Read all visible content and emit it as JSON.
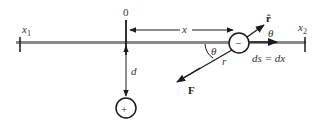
{
  "diagram": {
    "origin_label": "0",
    "x1_label": "x",
    "x1_sub": "1",
    "x2_label": "x",
    "x2_sub": "2",
    "x_label": "x",
    "d_label": "d",
    "theta_label_1": "θ",
    "theta_label_2": "θ",
    "r_label": "r",
    "rhat_label": "r̂",
    "F_label": "F",
    "ds_label": "ds = dx",
    "neg_charge": "−",
    "pos_charge": "+",
    "colors": {
      "axis_line": "#8a8a8a",
      "ink": "#1a1a1a"
    }
  }
}
